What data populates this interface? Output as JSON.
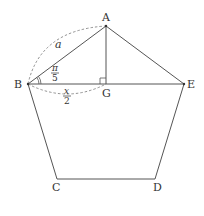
{
  "diagram": {
    "type": "regular-pentagon",
    "stroke_color": "#555555",
    "vertices": {
      "A": {
        "label": "A",
        "x": 106,
        "y": 26
      },
      "B": {
        "label": "B",
        "x": 28,
        "y": 84
      },
      "C": {
        "label": "C",
        "x": 57,
        "y": 179
      },
      "D": {
        "label": "D",
        "x": 155,
        "y": 179
      },
      "E": {
        "label": "E",
        "x": 184,
        "y": 84
      },
      "G": {
        "label": "G",
        "x": 106,
        "y": 84
      }
    },
    "annotations": {
      "side_label": "a",
      "angle_num": "π",
      "angle_den": "5",
      "half_num": "x",
      "half_den": "2"
    }
  }
}
